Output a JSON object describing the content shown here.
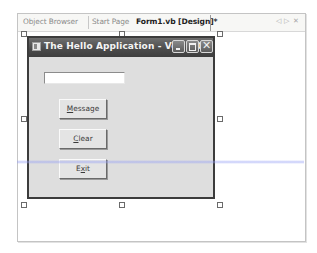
{
  "tabs": [
    {
      "label": "Object Browser",
      "active": false
    },
    {
      "label": "Start Page",
      "active": false
    },
    {
      "label": "Form1.vb [Design]*",
      "active": true
    }
  ],
  "tab_controls": {
    "scroll_left_icon": "◁",
    "scroll_right_icon": "▷",
    "close_icon": "✕"
  },
  "form": {
    "title": "The Hello Application - Ver. 3.0",
    "title_buttons": {
      "minimize": "minimize-icon",
      "maximize": "maximize-icon",
      "close": "✕"
    },
    "textbox": {
      "value": ""
    },
    "buttons": [
      {
        "label": "Message",
        "mnemonic": "M",
        "rest": "essage"
      },
      {
        "label": "Clear",
        "mnemonic": "C",
        "rest": "lear"
      },
      {
        "label": "Exit",
        "prefix": "E",
        "mnemonic": "x",
        "rest": "it"
      }
    ]
  },
  "colors": {
    "titlebar": "#4a4a4a",
    "form_background": "#dedede",
    "grid_dot": "#8c8c8c",
    "selection_band": "#96a0f5"
  }
}
